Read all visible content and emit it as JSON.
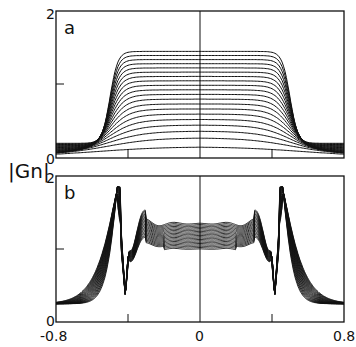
{
  "chart_data": [
    {
      "type": "line",
      "panel": "a",
      "title": "a",
      "xlabel": "",
      "ylabel": "|Gn|",
      "xlim": [
        -0.8,
        0.8
      ],
      "ylim": [
        0,
        2
      ],
      "y_ticks": [
        "0",
        "2"
      ],
      "x_ticks": [
        -0.4,
        0,
        0.4
      ],
      "description": "Family of ~20 curves; plateau heights increase from ~0.15 to ~1.45, with steep edges near x=±0.5 and tails ~0.2 at x=±0.8",
      "series_count": 20,
      "plateau_max": 1.45,
      "plateau_min": 0.15
    },
    {
      "type": "line",
      "panel": "b",
      "title": "b",
      "xlabel": "",
      "ylabel": "|Gn|",
      "xlim": [
        -0.8,
        0.8
      ],
      "ylim": [
        0,
        2
      ],
      "y_ticks": [
        "0",
        "2"
      ],
      "x_tick_labels": [
        "-0.8",
        "0",
        "0.8"
      ],
      "x_ticks": [
        -0.4,
        0,
        0.4
      ],
      "description": "Family of oscillating curves; peaks ~1.8 near x=±0.46, dips ~0.35 near x=±0.4 and ±0.26, central plateau ~1.1-1.3",
      "series_count": 20,
      "peak_value": 1.8,
      "plateau_value": 1.2
    }
  ],
  "labels": {
    "panel_a": "a",
    "panel_b": "b",
    "ylabel": "|Gn|",
    "y_top_a": "2",
    "y_bottom_a": "0",
    "y_top_b": "2",
    "y_bottom_b": "0",
    "x_left": "-0.8",
    "x_mid": "0",
    "x_right": "0.8"
  }
}
